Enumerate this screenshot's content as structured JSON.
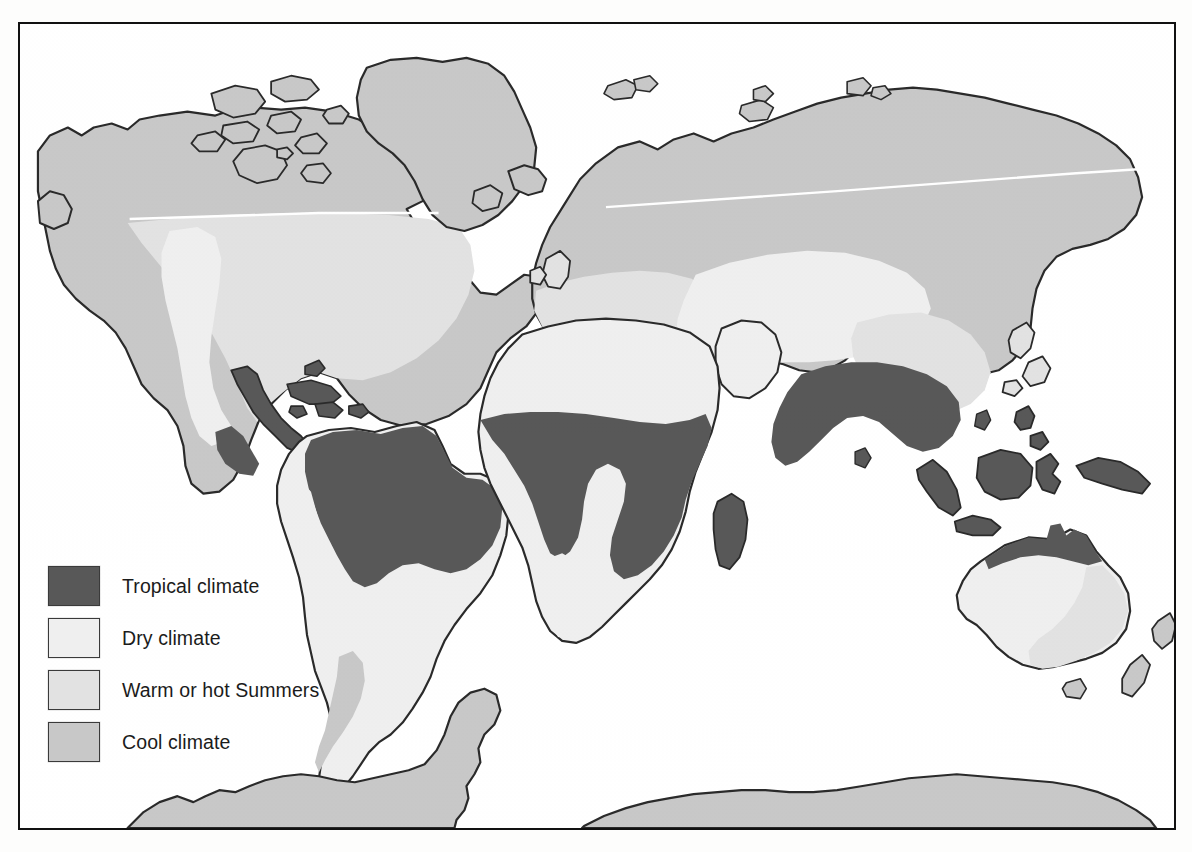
{
  "figure": {
    "kind": "world-climate-map",
    "frame": {
      "border_color": "#111111"
    },
    "background": "#ffffff"
  },
  "legend": {
    "items": [
      {
        "label": "Tropical climate",
        "color": "#585858",
        "key": "tropical"
      },
      {
        "label": "Dry climate",
        "color": "#efefef",
        "key": "dry"
      },
      {
        "label": "Warm or hot Summers",
        "color": "#e2e2e2",
        "key": "warm"
      },
      {
        "label": "Cool climate",
        "color": "#c8c8c8",
        "key": "cool"
      }
    ]
  },
  "map": {
    "coastline_color": "#2a2a2a",
    "ocean_color": "#ffffff",
    "regions": [
      {
        "name": "north-america-cool",
        "climate": "cool"
      },
      {
        "name": "greenland",
        "climate": "cool"
      },
      {
        "name": "iceland",
        "climate": "cool"
      },
      {
        "name": "canadian-arctic-islands",
        "climate": "cool"
      },
      {
        "name": "united-states-warm",
        "climate": "warm"
      },
      {
        "name": "american-southwest-dry",
        "climate": "dry"
      },
      {
        "name": "mexico-tropical",
        "climate": "tropical"
      },
      {
        "name": "central-america",
        "climate": "tropical"
      },
      {
        "name": "caribbean-islands",
        "climate": "tropical"
      },
      {
        "name": "amazon-basin",
        "climate": "tropical"
      },
      {
        "name": "andes-dry-strip",
        "climate": "dry"
      },
      {
        "name": "southern-cone-dry",
        "climate": "dry"
      },
      {
        "name": "patagonia-cool",
        "climate": "cool"
      },
      {
        "name": "sahara-dry",
        "climate": "dry"
      },
      {
        "name": "equatorial-africa",
        "climate": "tropical"
      },
      {
        "name": "kalahari-dry",
        "climate": "dry"
      },
      {
        "name": "madagascar",
        "climate": "tropical"
      },
      {
        "name": "europe-warm",
        "climate": "warm"
      },
      {
        "name": "siberia-cool",
        "climate": "cool"
      },
      {
        "name": "central-asia-dry",
        "climate": "dry"
      },
      {
        "name": "arabia-dry",
        "climate": "dry"
      },
      {
        "name": "china-warm",
        "climate": "warm"
      },
      {
        "name": "japan-warm",
        "climate": "warm"
      },
      {
        "name": "india-tropical",
        "climate": "tropical"
      },
      {
        "name": "southeast-asia",
        "climate": "tropical"
      },
      {
        "name": "indonesia",
        "climate": "tropical"
      },
      {
        "name": "new-guinea",
        "climate": "tropical"
      },
      {
        "name": "australia-north",
        "climate": "tropical"
      },
      {
        "name": "australia-interior-dry",
        "climate": "dry"
      },
      {
        "name": "australia-east-warm",
        "climate": "warm"
      },
      {
        "name": "new-zealand",
        "climate": "warm"
      },
      {
        "name": "antarctica",
        "climate": "cool"
      }
    ],
    "graticule": {
      "latitude_line": "white-horizontal-boundary"
    }
  }
}
